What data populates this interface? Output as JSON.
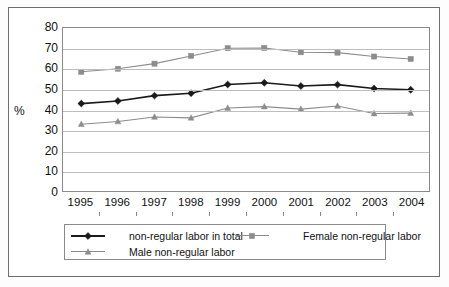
{
  "chart_data": {
    "type": "line",
    "title": "",
    "xlabel": "",
    "ylabel": "%",
    "ylim": [
      0,
      80
    ],
    "ytick_step": 10,
    "yticks": [
      80,
      70,
      60,
      50,
      40,
      30,
      20,
      10,
      0
    ],
    "grid": true,
    "legend_position": "bottom",
    "categories": [
      "1995",
      "1996",
      "1997",
      "1998",
      "1999",
      "2000",
      "2001",
      "2002",
      "2003",
      "2004"
    ],
    "series": [
      {
        "name": "non-regular labor in total",
        "marker": "diamond",
        "color": "#1a1a1a",
        "values": [
          42.9,
          44.2,
          46.8,
          48.0,
          52.3,
          53.1,
          51.5,
          52.2,
          50.3,
          49.7
        ]
      },
      {
        "name": "Female non-regular labor",
        "marker": "square",
        "color": "#8c8c8c",
        "values": [
          58.5,
          60.0,
          62.5,
          66.3,
          70.1,
          70.2,
          68.1,
          67.9,
          66.0,
          64.8
        ]
      },
      {
        "name": "Male non-regular labor",
        "marker": "triangle",
        "color": "#8c8c8c",
        "values": [
          32.8,
          34.1,
          36.3,
          35.9,
          40.7,
          41.4,
          40.2,
          41.7,
          38.0,
          38.2
        ]
      }
    ]
  },
  "axis": {
    "y_label_text": "%"
  },
  "legend": {
    "items": [
      {
        "label": "non-regular labor in total"
      },
      {
        "label": "Female non-regular labor"
      },
      {
        "label": "Male non-regular labor"
      }
    ]
  }
}
